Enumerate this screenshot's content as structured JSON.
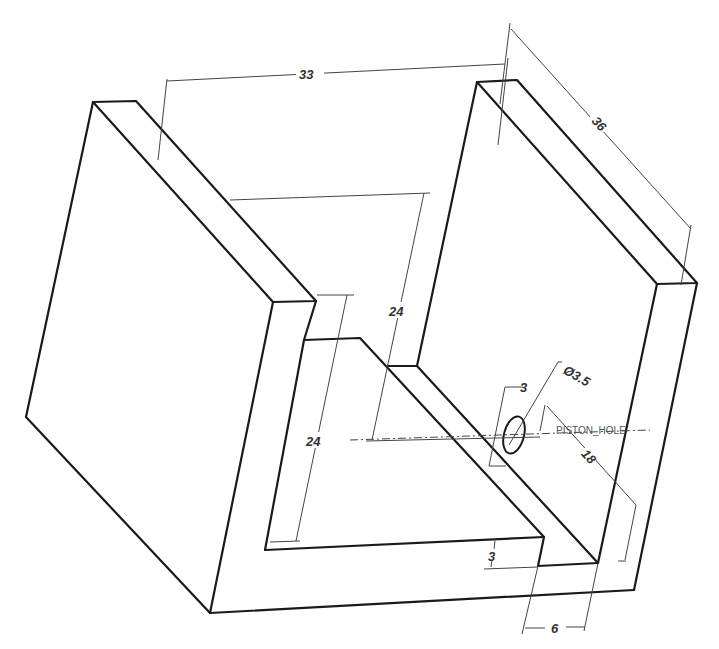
{
  "drawing": {
    "type": "isometric-cad-part-drawing",
    "part": "u-channel-bracket",
    "colors": {
      "background": "#ffffff",
      "edge": "#1a1a1a",
      "dimension": "#444444",
      "label": "#555555"
    }
  },
  "dimensions": {
    "overall_width": "33",
    "depth": "36",
    "inner_height_back": "24",
    "inner_height_front": "24",
    "hole_offset": "3",
    "hole_diameter": "Ø3.5",
    "hole_position": "18",
    "floor_thickness": "3",
    "wall_thickness": "6"
  },
  "labels": {
    "hole_name": "PISTON_HOLE"
  }
}
